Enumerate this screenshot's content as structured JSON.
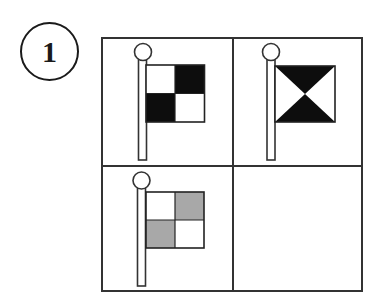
{
  "question": {
    "number": "1"
  },
  "colors": {
    "line": "#333333",
    "black": "#0d0d0d",
    "gray": "#a8a8a8",
    "white": "#ffffff"
  },
  "grid": {
    "rows": 2,
    "cols": 2,
    "cells": [
      {
        "position": "top-left",
        "content": "flag",
        "pattern": "checkered",
        "fill_top_left": "white",
        "fill_top_right": "black",
        "fill_bottom_left": "black",
        "fill_bottom_right": "white"
      },
      {
        "position": "top-right",
        "content": "flag",
        "pattern": "hourglass",
        "fill_triangles": "black"
      },
      {
        "position": "bottom-left",
        "content": "flag",
        "pattern": "checkered",
        "fill_top_left": "white",
        "fill_top_right": "gray",
        "fill_bottom_left": "gray",
        "fill_bottom_right": "white"
      },
      {
        "position": "bottom-right",
        "content": "empty"
      }
    ]
  }
}
